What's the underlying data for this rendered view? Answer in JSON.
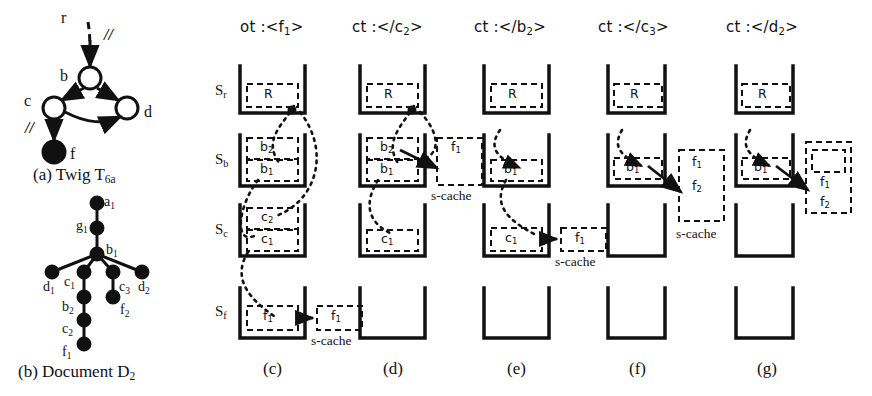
{
  "figure": {
    "panels": [
      {
        "id": "a",
        "caption": "(a) Twig T",
        "caption_sub": "6a"
      },
      {
        "id": "b",
        "caption": "(b) Document D",
        "caption_sub": "2"
      },
      {
        "id": "c",
        "caption": "(c)",
        "header_prefix": "ot :<",
        "header_name": "f",
        "header_sub": "1",
        "header_suffix": ">"
      },
      {
        "id": "d",
        "caption": "(d)",
        "header_prefix": "ct :</",
        "header_name": "c",
        "header_sub": "2",
        "header_suffix": ">"
      },
      {
        "id": "e",
        "caption": "(e)",
        "header_prefix": "ct :</",
        "header_name": "b",
        "header_sub": "2",
        "header_suffix": ">"
      },
      {
        "id": "f",
        "caption": "(f)",
        "header_prefix": "ct :</",
        "header_name": "c",
        "header_sub": "3",
        "header_suffix": ">"
      },
      {
        "id": "g",
        "caption": "(g)",
        "header_prefix": "ct :</",
        "header_name": "d",
        "header_sub": "2",
        "header_suffix": ">"
      }
    ]
  },
  "twig": {
    "title_main": "(a) Twig T",
    "title_sub": "6a",
    "nodes": [
      {
        "name": "r",
        "label": "r",
        "filled": false,
        "virtual": true
      },
      {
        "name": "b",
        "label": "b",
        "filled": false
      },
      {
        "name": "c",
        "label": "c",
        "filled": false
      },
      {
        "name": "d",
        "label": "d",
        "filled": false
      },
      {
        "name": "f",
        "label": "f",
        "filled": true
      }
    ],
    "edge_marks": [
      "//",
      "//"
    ]
  },
  "document": {
    "title_main": "(b) Document D",
    "title_sub": "2",
    "nodes": [
      {
        "label": "a",
        "sub": "1"
      },
      {
        "label": "g",
        "sub": "1"
      },
      {
        "label": "b",
        "sub": "1"
      },
      {
        "label": "d",
        "sub": "1"
      },
      {
        "label": "c",
        "sub": "1"
      },
      {
        "label": "c",
        "sub": "3"
      },
      {
        "label": "d",
        "sub": "2"
      },
      {
        "label": "b",
        "sub": "2"
      },
      {
        "label": "f",
        "sub": "2"
      },
      {
        "label": "c",
        "sub": "2"
      },
      {
        "label": "f",
        "sub": "1"
      }
    ]
  },
  "stack_labels": [
    {
      "main": "S",
      "sub": "r"
    },
    {
      "main": "S",
      "sub": "b"
    },
    {
      "main": "S",
      "sub": "c"
    },
    {
      "main": "S",
      "sub": "f"
    }
  ],
  "scache_label": "s-cache",
  "panels_detail": {
    "c": {
      "header": {
        "prefix": "ot :<",
        "name": "f",
        "sub": "1",
        "suffix": ">"
      },
      "caption": "(c)",
      "stacks": [
        {
          "name": "Sr",
          "cells": [
            {
              "label": "R",
              "sub": ""
            }
          ]
        },
        {
          "name": "Sb",
          "cells": [
            {
              "label": "b",
              "sub": "2"
            },
            {
              "label": "b",
              "sub": "1"
            }
          ]
        },
        {
          "name": "Sc",
          "cells": [
            {
              "label": "c",
              "sub": "2"
            },
            {
              "label": "c",
              "sub": "1"
            }
          ]
        },
        {
          "name": "Sf",
          "cells": [
            {
              "label": "f",
              "sub": "1"
            }
          ]
        }
      ],
      "cache": {
        "present": true,
        "items": [
          {
            "label": "f",
            "sub": "1"
          }
        ],
        "attached_to": "Sf"
      }
    },
    "d": {
      "header": {
        "prefix": "ct :</",
        "name": "c",
        "sub": "2",
        "suffix": ">"
      },
      "caption": "(d)",
      "stacks": [
        {
          "name": "Sr",
          "cells": [
            {
              "label": "R",
              "sub": ""
            }
          ]
        },
        {
          "name": "Sb",
          "cells": [
            {
              "label": "b",
              "sub": "2"
            },
            {
              "label": "b",
              "sub": "1"
            }
          ]
        },
        {
          "name": "Sc",
          "cells": [
            {
              "label": "c",
              "sub": "1"
            }
          ]
        },
        {
          "name": "Sf",
          "cells": []
        }
      ],
      "cache": {
        "present": true,
        "items": [
          {
            "label": "f",
            "sub": "1"
          }
        ],
        "attached_to": "Sb"
      }
    },
    "e": {
      "header": {
        "prefix": "ct :</",
        "name": "b",
        "sub": "2",
        "suffix": ">"
      },
      "caption": "(e)",
      "stacks": [
        {
          "name": "Sr",
          "cells": [
            {
              "label": "R",
              "sub": ""
            }
          ]
        },
        {
          "name": "Sb",
          "cells": [
            {
              "label": "b",
              "sub": "1"
            }
          ]
        },
        {
          "name": "Sc",
          "cells": [
            {
              "label": "c",
              "sub": "1"
            }
          ]
        },
        {
          "name": "Sf",
          "cells": []
        }
      ],
      "cache": {
        "present": true,
        "items": [
          {
            "label": "f",
            "sub": "1"
          }
        ],
        "attached_to": "Sc"
      }
    },
    "f": {
      "header": {
        "prefix": "ct :</",
        "name": "c",
        "sub": "3",
        "suffix": ">"
      },
      "caption": "(f)",
      "stacks": [
        {
          "name": "Sr",
          "cells": [
            {
              "label": "R",
              "sub": ""
            }
          ]
        },
        {
          "name": "Sb",
          "cells": [
            {
              "label": "b",
              "sub": "1"
            }
          ]
        },
        {
          "name": "Sc",
          "cells": []
        },
        {
          "name": "Sf",
          "cells": []
        }
      ],
      "cache": {
        "present": true,
        "items": [
          {
            "label": "f",
            "sub": "1"
          },
          {
            "label": "f",
            "sub": "2"
          }
        ],
        "attached_to": "Sb"
      }
    },
    "g": {
      "header": {
        "prefix": "ct :</",
        "name": "d",
        "sub": "2",
        "suffix": ">"
      },
      "caption": "(g)",
      "stacks": [
        {
          "name": "Sr",
          "cells": [
            {
              "label": "R",
              "sub": ""
            }
          ]
        },
        {
          "name": "Sb",
          "cells": [
            {
              "label": "b",
              "sub": "1"
            }
          ]
        },
        {
          "name": "Sc",
          "cells": []
        },
        {
          "name": "Sf",
          "cells": []
        }
      ],
      "cache": {
        "present": true,
        "items": [
          {
            "label": "f",
            "sub": "1"
          },
          {
            "label": "f",
            "sub": "2"
          }
        ],
        "attached_to": "Sb"
      }
    }
  },
  "colors": {
    "ink": "#111111",
    "paper": "#ffffff"
  }
}
